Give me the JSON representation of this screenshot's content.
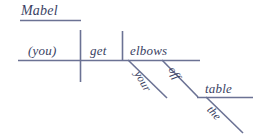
{
  "diagram": {
    "type": "reed-kellogg-sentence-diagram",
    "sentence": "Mabel, get your elbows off the table.",
    "line_color": "#6b7294",
    "text_color": "#3a3f63",
    "background_color": "#ffffff",
    "words": {
      "vocative": "Mabel",
      "subject": "(you)",
      "verb": "get",
      "direct_object": "elbows",
      "object_modifier": "your",
      "preposition": "off",
      "prep_object": "table",
      "prep_object_modifier": "the"
    },
    "labels": [
      {
        "id": "mabel",
        "text": "Mabel",
        "role": "noun of direct address"
      },
      {
        "id": "you",
        "text": "(you)",
        "role": "implied subject"
      },
      {
        "id": "get",
        "text": "get",
        "role": "verb"
      },
      {
        "id": "elbows",
        "text": "elbows",
        "role": "direct object"
      },
      {
        "id": "your",
        "text": "your",
        "role": "possessive modifier"
      },
      {
        "id": "off",
        "text": "off",
        "role": "preposition"
      },
      {
        "id": "table",
        "text": "table",
        "role": "object of preposition"
      },
      {
        "id": "the",
        "text": "the",
        "role": "article modifier"
      }
    ]
  }
}
